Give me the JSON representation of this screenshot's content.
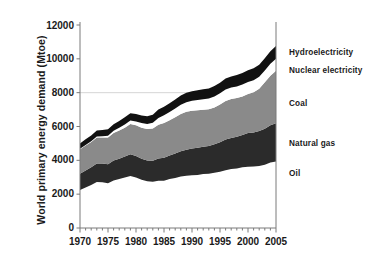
{
  "chart_data": {
    "type": "area",
    "stacked": true,
    "title": "",
    "xlabel": "",
    "ylabel": "World primary energy demand (Mtoe)",
    "xlim": [
      1970,
      2005
    ],
    "ylim": [
      0,
      12000
    ],
    "grid": "horizontal-gridline-at-8000",
    "legend_position": "right-of-plot-inline",
    "xticks": [
      1970,
      1975,
      1980,
      1985,
      1990,
      1995,
      2000,
      2005
    ],
    "yticks": [
      0,
      2000,
      4000,
      6000,
      8000,
      10000,
      12000
    ],
    "x": [
      1970,
      1971,
      1972,
      1973,
      1974,
      1975,
      1976,
      1977,
      1978,
      1979,
      1980,
      1981,
      1982,
      1983,
      1984,
      1985,
      1986,
      1987,
      1988,
      1989,
      1990,
      1991,
      1992,
      1993,
      1994,
      1995,
      1996,
      1997,
      1998,
      1999,
      2000,
      2001,
      2002,
      2003,
      2004,
      2005
    ],
    "series": [
      {
        "name": "Oil",
        "color": "#ffffff",
        "values": [
          2250,
          2400,
          2540,
          2720,
          2700,
          2650,
          2810,
          2900,
          2990,
          3080,
          2980,
          2850,
          2760,
          2740,
          2790,
          2800,
          2900,
          2960,
          3040,
          3090,
          3120,
          3140,
          3190,
          3200,
          3270,
          3330,
          3410,
          3490,
          3520,
          3590,
          3620,
          3640,
          3660,
          3740,
          3870,
          3930
        ]
      },
      {
        "name": "Natural gas",
        "color": "#2b2b2b",
        "values": [
          950,
          1000,
          1050,
          1100,
          1110,
          1120,
          1180,
          1190,
          1230,
          1280,
          1270,
          1250,
          1230,
          1240,
          1320,
          1350,
          1380,
          1440,
          1490,
          1540,
          1580,
          1610,
          1620,
          1650,
          1680,
          1740,
          1820,
          1830,
          1870,
          1910,
          1990,
          2010,
          2070,
          2130,
          2200,
          2260
        ]
      },
      {
        "name": "Coal",
        "color": "#8a8a8a",
        "values": [
          1450,
          1470,
          1490,
          1530,
          1540,
          1580,
          1630,
          1680,
          1710,
          1790,
          1820,
          1830,
          1860,
          1900,
          1990,
          2060,
          2090,
          2150,
          2210,
          2240,
          2230,
          2210,
          2180,
          2170,
          2180,
          2230,
          2280,
          2300,
          2290,
          2280,
          2310,
          2380,
          2500,
          2740,
          2930,
          3100
        ]
      },
      {
        "name": "Nuclear electricity",
        "color": "#ffffff",
        "values": [
          30,
          40,
          50,
          60,
          80,
          110,
          130,
          160,
          190,
          200,
          230,
          270,
          300,
          340,
          400,
          450,
          480,
          510,
          550,
          570,
          590,
          610,
          620,
          630,
          650,
          660,
          680,
          680,
          690,
          700,
          710,
          710,
          710,
          700,
          710,
          710
        ]
      },
      {
        "name": "Hydroelectricity",
        "color": "#111111",
        "values": [
          320,
          330,
          340,
          350,
          360,
          380,
          390,
          400,
          420,
          430,
          440,
          450,
          460,
          480,
          500,
          510,
          520,
          530,
          540,
          550,
          570,
          580,
          590,
          600,
          620,
          630,
          650,
          660,
          670,
          680,
          700,
          700,
          710,
          720,
          740,
          760
        ]
      }
    ],
    "totals_endpoints": {
      "1970": 5000,
      "2005": 10760
    }
  },
  "axis": {
    "y_label": "World primary energy demand (Mtoe)",
    "y_tick_labels": [
      "12000",
      "10000",
      "8000",
      "6000",
      "4000",
      "2000",
      "0"
    ],
    "x_tick_labels": [
      "1970",
      "1975",
      "1980",
      "1985",
      "1990",
      "1995",
      "2000",
      "2005"
    ]
  },
  "series_labels": {
    "hydroelectricity": "Hydroelectricity",
    "nuclear_electricity": "Nuclear electricity",
    "coal": "Coal",
    "natural_gas": "Natural gas",
    "oil": "Oil"
  },
  "colors": {
    "oil": "#ffffff",
    "natural_gas": "#2b2b2b",
    "coal": "#8a8a8a",
    "nuclear": "#ffffff",
    "hydro": "#111111",
    "axis": "#7a7a7a",
    "text": "#1a1a1a",
    "gridline": "#cccccc"
  }
}
